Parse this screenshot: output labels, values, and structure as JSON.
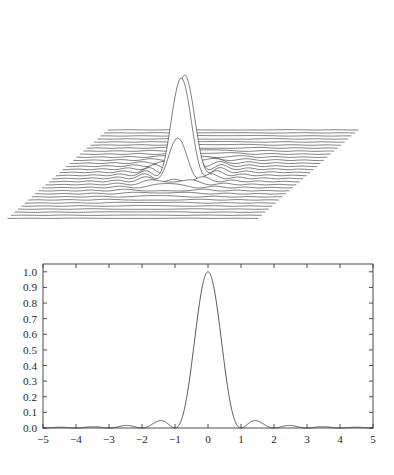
{
  "figure": {
    "title": "",
    "panels": [
      {
        "id": "surface",
        "name": "sinc-squared-surface-mesh"
      },
      {
        "id": "profile",
        "name": "sinc-squared-profile"
      }
    ]
  },
  "chart_data": [
    {
      "type": "line",
      "id": "surface-waterfall",
      "title": "",
      "subtitle": "",
      "xlabel": "",
      "ylabel": "",
      "zlabel": "",
      "grid": false,
      "legend": null,
      "render": "waterfall-mesh",
      "description": "Two-dimensional Airy / sinc-squared diffraction surface drawn as a stack of constant-y cross-section lines in oblique projection. A single tall central lobe rises at the centre with low concentric side-lobe ripples around its base.",
      "surface_function": "f(x,y) = (sin(r)/r)^2 with r = pi*sqrt(x^2+y^2)",
      "x_range": [
        -5,
        5
      ],
      "y_range": [
        -5,
        5
      ],
      "z_range": [
        0,
        1
      ],
      "n_rows": 30,
      "n_cols": 121,
      "peak_value": 1.0,
      "peak_position": [
        0,
        0
      ],
      "side_lobe_peaks": [
        0.0472,
        0.0165,
        0.0083
      ],
      "zeros_at": [
        1,
        2,
        3,
        4,
        5
      ],
      "projection": {
        "row_x_shift": -3.45,
        "row_y_shift": -3.05,
        "z_scale": 108
      },
      "line_color": "#2b2b2b",
      "line_width": 0.6,
      "background": "#ffffff"
    },
    {
      "type": "line",
      "id": "profile",
      "title": "",
      "subtitle": "",
      "xlabel": "",
      "ylabel": "",
      "grid": false,
      "legend": null,
      "description": "One-dimensional cut through the surface: the squared sinc (Airy) profile.",
      "function": "f(x) = (sin(pi*x)/(pi*x))^2",
      "xlim": [
        -5,
        5
      ],
      "ylim": [
        0.0,
        1.05
      ],
      "x_ticks": [
        -5,
        -4,
        -3,
        -2,
        -1,
        0,
        1,
        2,
        3,
        4,
        5
      ],
      "x_tick_labels": [
        "−5",
        "−4",
        "−3",
        "−2",
        "−1",
        "0",
        "1",
        "2",
        "3",
        "4",
        "5"
      ],
      "y_ticks": [
        0.0,
        0.1,
        0.2,
        0.3,
        0.4,
        0.5,
        0.6,
        0.7,
        0.8,
        0.9,
        1.0
      ],
      "y_tick_labels": [
        "0.0",
        "0.1",
        "0.2",
        "0.3",
        "0.4",
        "0.5",
        "0.6",
        "0.7",
        "0.8",
        "0.9",
        "1.0"
      ],
      "tick_direction": "in",
      "frame": "box",
      "x": [
        -5.0,
        -4.8,
        -4.6,
        -4.4,
        -4.2,
        -4.0,
        -3.8,
        -3.6,
        -3.4,
        -3.2,
        -3.0,
        -2.8,
        -2.6,
        -2.4,
        -2.2,
        -2.0,
        -1.8,
        -1.6,
        -1.4,
        -1.2,
        -1.0,
        -0.8,
        -0.6,
        -0.4,
        -0.2,
        0.0,
        0.2,
        0.4,
        0.6,
        0.8,
        1.0,
        1.2,
        1.4,
        1.6,
        1.8,
        2.0,
        2.2,
        2.4,
        2.6,
        2.8,
        3.0,
        3.2,
        3.4,
        3.6,
        3.8,
        4.0,
        4.2,
        4.4,
        4.6,
        4.8,
        5.0
      ],
      "y": [
        0.0,
        0.0015,
        0.0042,
        0.005,
        0.0028,
        0.0,
        0.0031,
        0.0066,
        0.0072,
        0.0039,
        0.0,
        0.0051,
        0.0112,
        0.0125,
        0.007,
        0.0,
        0.0104,
        0.0243,
        0.0288,
        0.017,
        0.0,
        0.0345,
        0.0875,
        0.1171,
        0.0757,
        1.0,
        0.8754,
        0.5728,
        0.2546,
        0.0552,
        0.0,
        0.017,
        0.0288,
        0.0243,
        0.0104,
        0.0,
        0.007,
        0.0125,
        0.0112,
        0.0051,
        0.0,
        0.0039,
        0.0072,
        0.0066,
        0.0031,
        0.0,
        0.0028,
        0.005,
        0.0042,
        0.0015,
        0.0
      ],
      "line_color": "#2b2b2b",
      "line_width": 0.8,
      "axis_color": "#3a3a3a",
      "background": "#ffffff"
    }
  ]
}
